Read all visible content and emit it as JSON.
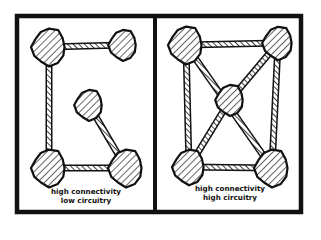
{
  "panels": [
    {
      "id": "left",
      "label_line1": "high connectivity",
      "label_line2": "low circuitry",
      "nodes": [
        {
          "name": "top-left",
          "x": 49,
          "y": 47,
          "r": 17
        },
        {
          "name": "top-right",
          "x": 123,
          "y": 45,
          "r": 14
        },
        {
          "name": "center",
          "x": 89,
          "y": 105,
          "r": 14
        },
        {
          "name": "bottom-left",
          "x": 49,
          "y": 168,
          "r": 17
        },
        {
          "name": "bottom-right",
          "x": 126,
          "y": 168,
          "r": 17
        }
      ],
      "links": [
        [
          0,
          1
        ],
        [
          0,
          3
        ],
        [
          3,
          4
        ],
        [
          2,
          4
        ]
      ]
    },
    {
      "id": "right",
      "label_line1": "high connectivity",
      "label_line2": "high circuitry",
      "nodes": [
        {
          "name": "top-left",
          "x": 186,
          "y": 45,
          "r": 17
        },
        {
          "name": "top-right",
          "x": 278,
          "y": 43,
          "r": 15
        },
        {
          "name": "center",
          "x": 230,
          "y": 100,
          "r": 14
        },
        {
          "name": "bottom-left",
          "x": 189,
          "y": 167,
          "r": 16
        },
        {
          "name": "bottom-right",
          "x": 272,
          "y": 168,
          "r": 17
        }
      ],
      "links": [
        [
          0,
          1
        ],
        [
          0,
          3
        ],
        [
          1,
          4
        ],
        [
          3,
          4
        ],
        [
          0,
          4
        ],
        [
          1,
          2
        ],
        [
          2,
          3
        ]
      ]
    }
  ],
  "colors": {
    "ink": "#111111",
    "paper": "#ffffff"
  }
}
